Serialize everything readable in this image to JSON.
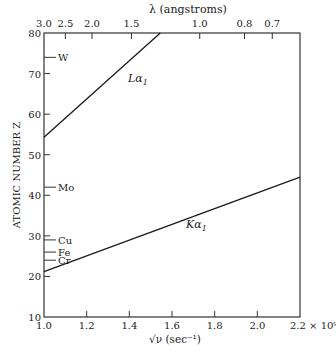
{
  "chart_data": {
    "type": "line",
    "title": "",
    "xlabel": "√ν (sec⁻¹)",
    "x_multiplier": "× 10⁹",
    "ylabel": "ATOMIC NUMBER Z",
    "top_xlabel": "λ (angstroms)",
    "xlim": [
      1.0,
      2.2
    ],
    "ylim": [
      10,
      80
    ],
    "grid": false,
    "x_ticks": [
      1.0,
      1.2,
      1.4,
      1.6,
      1.8,
      2.0,
      2.2
    ],
    "x_tick_labels": [
      "1.0",
      "1.2",
      "1.4",
      "1.6",
      "1.8",
      "2.0",
      "2.2 × 10⁹"
    ],
    "y_ticks": [
      10,
      20,
      30,
      40,
      50,
      60,
      70,
      80
    ],
    "y_tick_labels": [
      "10",
      "20",
      "30",
      "40",
      "50",
      "60",
      "70",
      "80"
    ],
    "top_ticks": [
      {
        "label": "3.0",
        "x": 1.0
      },
      {
        "label": "2.5",
        "x": 1.1
      },
      {
        "label": "2.0",
        "x": 1.225
      },
      {
        "label": "1.5",
        "x": 1.41
      },
      {
        "label": "1.0",
        "x": 1.73
      },
      {
        "label": "0.8",
        "x": 1.94
      },
      {
        "label": "0.7",
        "x": 2.07
      }
    ],
    "series": [
      {
        "name": "Kα₁",
        "x": [
          1.0,
          2.2
        ],
        "y": [
          21.2,
          44.5
        ]
      },
      {
        "name": "Lα₁",
        "x": [
          1.0,
          1.545
        ],
        "y": [
          54.3,
          80
        ]
      }
    ],
    "annotations": [
      {
        "label": "W",
        "z": 74
      },
      {
        "label": "Mo",
        "z": 42
      },
      {
        "label": "Cu",
        "z": 29
      },
      {
        "label": "Fe",
        "z": 26
      },
      {
        "label": "Cr",
        "z": 24
      }
    ]
  },
  "labels": {
    "top_axis_title": "λ (angstroms)",
    "y_axis_title": "ATOMIC NUMBER Z",
    "x_axis_title": "√ν (sec⁻¹)",
    "ka_label": "Kα",
    "ka_sub": "1",
    "la_label": "Lα",
    "la_sub": "1"
  }
}
